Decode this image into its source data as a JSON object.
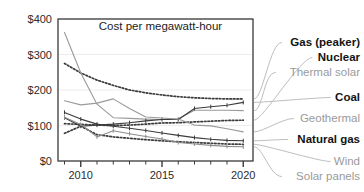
{
  "chart_data": {
    "type": "line",
    "title": "Cost per megawatt-hour",
    "xlabel": "",
    "ylabel": "",
    "xlim": [
      2008.6,
      2020.6
    ],
    "ylim": [
      0,
      400
    ],
    "grid": true,
    "legend_position": "right-labels-with-leader-lines",
    "ytick_labels": [
      "$0",
      "$100",
      "$200",
      "$300",
      "$400"
    ],
    "ytick_values": [
      0,
      100,
      200,
      300,
      400
    ],
    "xtick_labels": [
      "2010",
      "2015",
      "2020"
    ],
    "xtick_values": [
      2010,
      2015,
      2020
    ],
    "x": [
      2009,
      2010,
      2011,
      2012,
      2013,
      2014,
      2015,
      2016,
      2017,
      2018,
      2019,
      2020
    ],
    "series": [
      {
        "name": "Gas (peaker)",
        "style": "dotted",
        "color": "#3b3b3b",
        "label_color": "dark",
        "values": [
          275,
          248,
          228,
          213,
          200,
          192,
          186,
          181,
          178,
          176,
          175,
          175
        ]
      },
      {
        "name": "Nuclear",
        "style": "dotted",
        "color": "#3b3b3b",
        "label_color": "dark",
        "values": [
          105,
          103,
          101,
          100,
          101,
          104,
          107,
          108,
          110,
          112,
          114,
          115
        ]
      },
      {
        "name": "Thermal solar",
        "style": "solid",
        "color": "#9a9a9a",
        "label_color": "gray",
        "values": [
          362,
          248,
          160,
          122,
          120,
          118,
          117,
          119,
          143,
          143,
          143,
          142
        ]
      },
      {
        "name": "Coal",
        "style": "solid-marker",
        "color": "#3b3b3b",
        "label_color": "dark",
        "values": [
          122,
          98,
          101,
          104,
          108,
          113,
          117,
          117,
          148,
          153,
          157,
          165
        ]
      },
      {
        "name": "Geothermal",
        "style": "solid",
        "color": "#9a9a9a",
        "label_color": "gray",
        "values": [
          170,
          158,
          163,
          175,
          148,
          124,
          121,
          118,
          101,
          99,
          91,
          82
        ]
      },
      {
        "name": "Natural gas",
        "style": "solid-marker",
        "color": "#3b3b3b",
        "label_color": "dark",
        "values": [
          137,
          118,
          104,
          98,
          92,
          86,
          79,
          72,
          66,
          61,
          58,
          57
        ]
      },
      {
        "name": "Wind",
        "style": "dotted",
        "color": "#3b3b3b",
        "label_color": "gray",
        "values": [
          78,
          98,
          74,
          68,
          64,
          60,
          57,
          54,
          52,
          50,
          48,
          47
        ]
      },
      {
        "name": "Solar panels",
        "style": "solid-marker",
        "color": "#8d8d8d",
        "label_color": "gray",
        "values": [
          123,
          103,
          68,
          85,
          77,
          69,
          62,
          52,
          48,
          44,
          41,
          40
        ]
      }
    ],
    "right_labels": [
      {
        "text": "Gas (peaker)",
        "color": "dark"
      },
      {
        "text": "Nuclear",
        "color": "dark"
      },
      {
        "text": "Thermal solar",
        "color": "gray"
      },
      {
        "text": "Coal",
        "color": "dark"
      },
      {
        "text": "Geothermal",
        "color": "gray"
      },
      {
        "text": "Natural gas",
        "color": "dark"
      },
      {
        "text": "Wind",
        "color": "gray"
      },
      {
        "text": "Solar panels",
        "color": "gray"
      }
    ]
  }
}
